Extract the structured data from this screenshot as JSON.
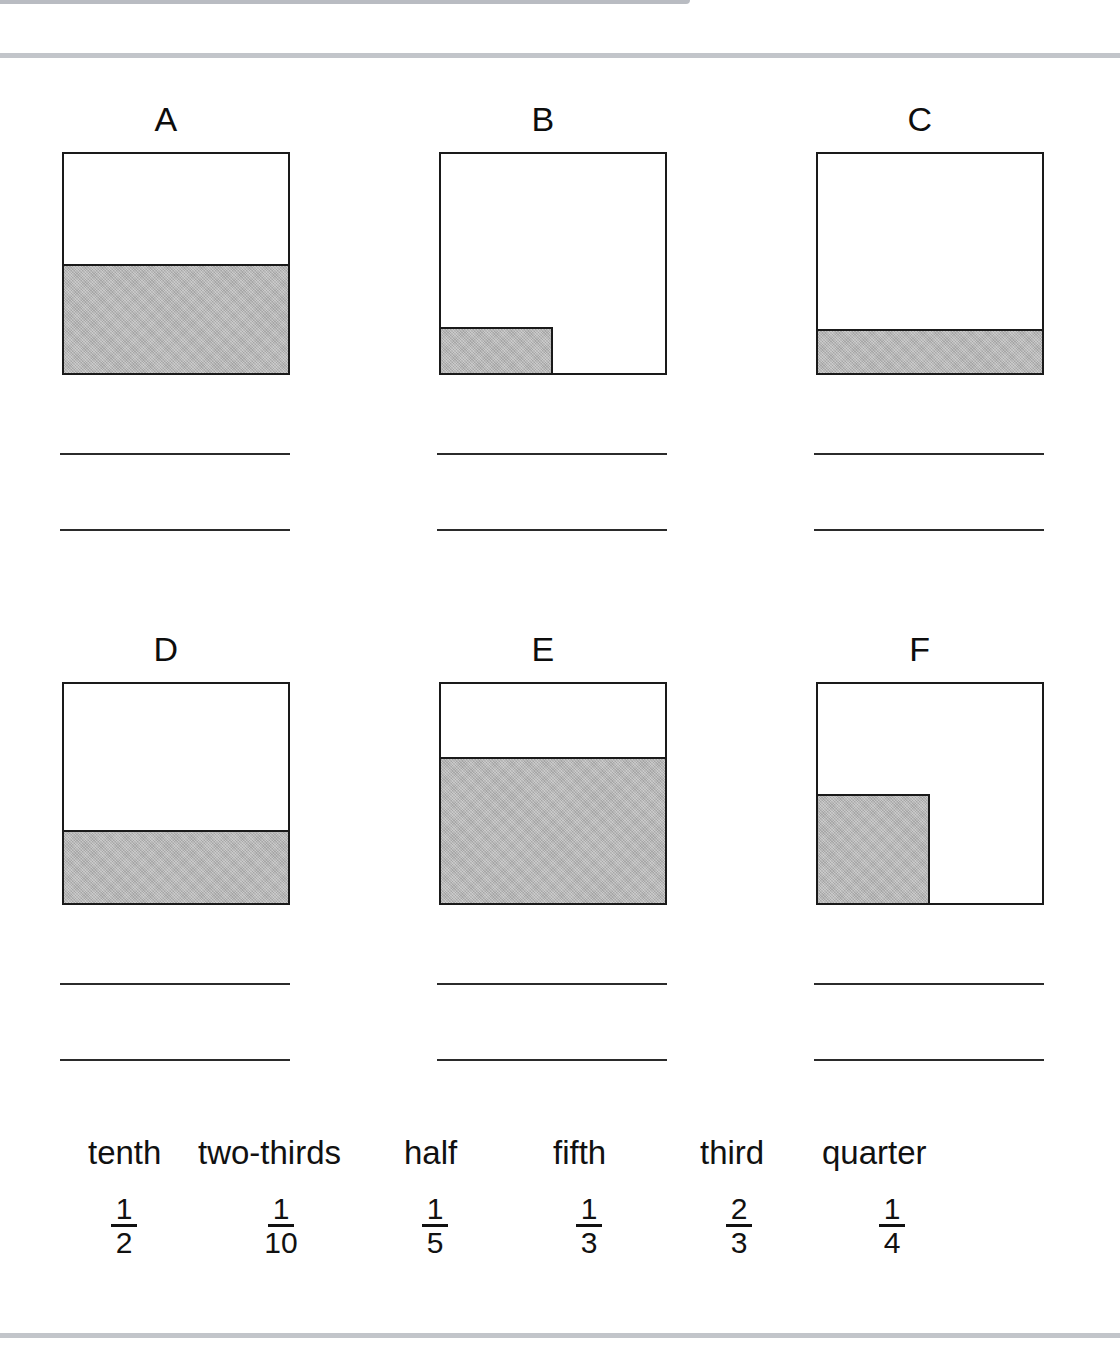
{
  "worksheet": {
    "title": "Fractions of shapes matching worksheet",
    "shade_color": "#b6b6b6",
    "outline_color": "#1a1a1a",
    "page_rule_color": "#c2c5ca"
  },
  "figures": [
    {
      "letter": "A",
      "shaded_fraction": "1/2",
      "shaded_name": "half",
      "shade": {
        "left_pct": 0,
        "top_pct": 50,
        "width_pct": 100,
        "height_pct": 50,
        "edges": "edge-top"
      }
    },
    {
      "letter": "B",
      "shaded_fraction": "1/10",
      "shaded_name": "tenth",
      "shade": {
        "left_pct": 0,
        "top_pct": 79,
        "width_pct": 50,
        "height_pct": 21,
        "edges": "edge-top edge-right"
      }
    },
    {
      "letter": "C",
      "shaded_fraction": "1/5",
      "shaded_name": "fifth",
      "shade": {
        "left_pct": 0,
        "top_pct": 80,
        "width_pct": 100,
        "height_pct": 20,
        "edges": "edge-top"
      }
    },
    {
      "letter": "D",
      "shaded_fraction": "1/3",
      "shaded_name": "third",
      "shade": {
        "left_pct": 0,
        "top_pct": 66.7,
        "width_pct": 100,
        "height_pct": 33.3,
        "edges": "edge-top"
      }
    },
    {
      "letter": "E",
      "shaded_fraction": "2/3",
      "shaded_name": "two-thirds",
      "shade": {
        "left_pct": 0,
        "top_pct": 33.3,
        "width_pct": 100,
        "height_pct": 66.7,
        "edges": "edge-top"
      }
    },
    {
      "letter": "F",
      "shaded_fraction": "1/4",
      "shaded_name": "quarter",
      "shade": {
        "left_pct": 0,
        "top_pct": 50,
        "width_pct": 50,
        "height_pct": 50,
        "edges": "edge-top edge-right"
      }
    }
  ],
  "word_bank": {
    "words": [
      {
        "label": "tenth",
        "x": 88
      },
      {
        "label": "two-thirds",
        "x": 198
      },
      {
        "label": "half",
        "x": 404
      },
      {
        "label": "fifth",
        "x": 553
      },
      {
        "label": "third",
        "x": 700
      },
      {
        "label": "quarter",
        "x": 822
      }
    ],
    "fractions": [
      {
        "numerator": "1",
        "denominator": "2",
        "x": 92
      },
      {
        "numerator": "1",
        "denominator": "10",
        "x": 249
      },
      {
        "numerator": "1",
        "denominator": "5",
        "x": 403
      },
      {
        "numerator": "1",
        "denominator": "3",
        "x": 557
      },
      {
        "numerator": "2",
        "denominator": "3",
        "x": 707
      },
      {
        "numerator": "1",
        "denominator": "4",
        "x": 860
      }
    ]
  },
  "chart_data": {
    "type": "bar",
    "xlabel": "Square",
    "ylabel": "Shaded fraction of area",
    "categories": [
      "A",
      "B",
      "C",
      "D",
      "E",
      "F"
    ],
    "values": [
      0.5,
      0.1,
      0.2,
      0.3333,
      0.6667,
      0.25
    ],
    "value_labels": [
      "1/2",
      "1/10",
      "1/5",
      "1/3",
      "2/3",
      "1/4"
    ],
    "word_labels": [
      "half",
      "tenth",
      "fifth",
      "third",
      "two-thirds",
      "quarter"
    ],
    "ylim": [
      0,
      1
    ],
    "grid": false,
    "legend": "none"
  }
}
